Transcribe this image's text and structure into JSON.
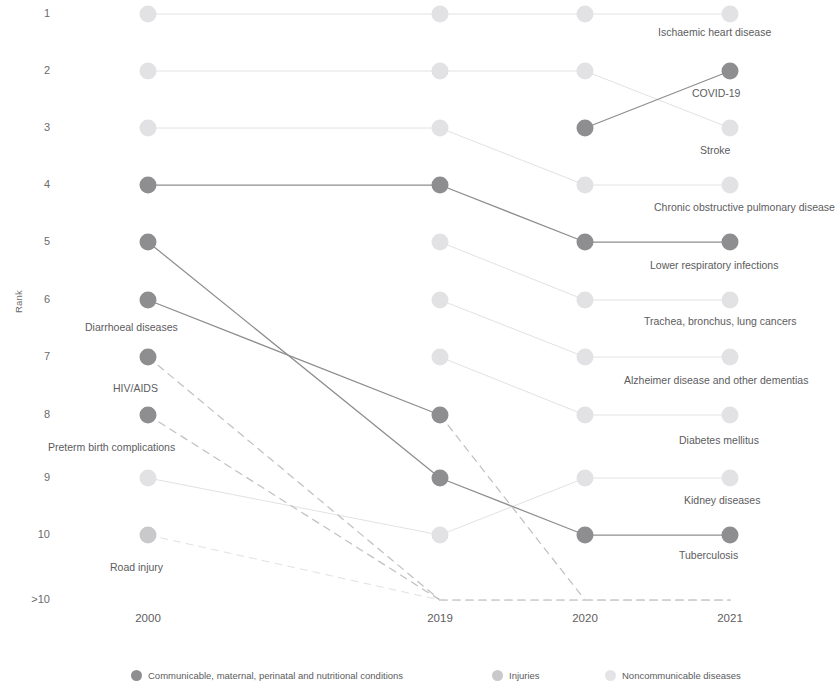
{
  "chart_data": {
    "type": "line",
    "title": "",
    "subtitle": "",
    "xlabel": "",
    "ylabel": "Rank",
    "x": [
      "2000",
      "2019",
      "2020",
      "2021"
    ],
    "ytick_labels": [
      "1",
      "2",
      "3",
      "4",
      "5",
      "6",
      "7",
      "8",
      "9",
      "10",
      ">10"
    ],
    "ylim": [
      1,
      11
    ],
    "grid": false,
    "legend_position": "bottom",
    "categories": [
      {
        "key": "communicable",
        "label": "Communicable, maternal, perinatal and nutritional conditions",
        "color": "#8e8e90"
      },
      {
        "key": "injuries",
        "label": "Injuries",
        "color": "#c9c9cb"
      },
      {
        "key": "noncommunicable",
        "label": "Noncommunicable diseases",
        "color": "#e2e2e4"
      }
    ],
    "series": [
      {
        "name": "Ischaemic heart disease",
        "category": "noncommunicable",
        "label_side": "right",
        "label_x": 2021,
        "ranks": [
          1,
          1,
          1,
          1
        ]
      },
      {
        "name": "Stroke",
        "category": "noncommunicable",
        "label_side": "right",
        "label_x": 2021,
        "ranks": [
          2,
          2,
          2,
          3
        ]
      },
      {
        "name": "COVID-19",
        "category": "communicable",
        "label_side": "right",
        "label_x": 2021,
        "ranks": [
          null,
          null,
          3,
          2
        ]
      },
      {
        "name": "Chronic obstructive pulmonary disease",
        "category": "noncommunicable",
        "label_side": "right",
        "label_x": 2021,
        "ranks": [
          3,
          3,
          4,
          4
        ]
      },
      {
        "name": "Lower respiratory infections",
        "category": "communicable",
        "label_side": "right",
        "label_x": 2021,
        "ranks": [
          4,
          4,
          5,
          5
        ]
      },
      {
        "name": "Trachea, bronchus, lung cancers",
        "category": "noncommunicable",
        "label_side": "right",
        "label_x": 2021,
        "ranks": [
          null,
          5,
          6,
          6
        ]
      },
      {
        "name": "Alzheimer disease and other dementias",
        "category": "noncommunicable",
        "label_side": "right",
        "label_x": 2021,
        "ranks": [
          null,
          6,
          7,
          7
        ]
      },
      {
        "name": "Diabetes mellitus",
        "category": "noncommunicable",
        "label_side": "right",
        "label_x": 2021,
        "ranks": [
          null,
          7,
          8,
          8
        ]
      },
      {
        "name": "Kidney diseases",
        "category": "noncommunicable",
        "label_side": "right",
        "label_x": 2021,
        "ranks": [
          9,
          10,
          9,
          9
        ]
      },
      {
        "name": "Tuberculosis",
        "category": "communicable",
        "label_side": "right",
        "label_x": 2021,
        "ranks": [
          5,
          9,
          10,
          10
        ]
      },
      {
        "name": "Diarrhoeal diseases",
        "category": "communicable",
        "label_side": "below",
        "label_x": 2000,
        "ranks": [
          6,
          8,
          11,
          11
        ]
      },
      {
        "name": "HIV/AIDS",
        "category": "communicable",
        "label_side": "below",
        "label_x": 2000,
        "ranks": [
          7,
          11,
          11,
          11
        ]
      },
      {
        "name": "Preterm birth complications",
        "category": "communicable",
        "label_side": "below",
        "label_x": 2000,
        "ranks": [
          8,
          11,
          11,
          11
        ]
      },
      {
        "name": "Road injury",
        "category": "injuries",
        "label_side": "below",
        "label_x": 2000,
        "ranks": [
          10,
          11,
          11,
          11
        ]
      }
    ]
  },
  "axis": {
    "y_label": "Rank",
    "y_ticks": [
      {
        "label": "1",
        "y": 14
      },
      {
        "label": "2",
        "y": 71
      },
      {
        "label": "3",
        "y": 128
      },
      {
        "label": "4",
        "y": 185
      },
      {
        "label": "5",
        "y": 242
      },
      {
        "label": "6",
        "y": 300
      },
      {
        "label": "7",
        "y": 357
      },
      {
        "label": "8",
        "y": 415
      },
      {
        "label": "9",
        "y": 478
      },
      {
        "label": "10",
        "y": 535
      },
      {
        "label": ">10",
        "y": 600
      }
    ],
    "x_ticks": [
      {
        "label": "2000",
        "x": 148
      },
      {
        "label": "2019",
        "x": 440
      },
      {
        "label": "2020",
        "x": 585
      },
      {
        "label": "2021",
        "x": 730
      }
    ]
  },
  "legend": {
    "items": [
      {
        "label": "Communicable, maternal, perinatal and nutritional conditions",
        "color": "#8e8e90",
        "x": 131
      },
      {
        "label": "Injuries",
        "color": "#c9c9cb",
        "x": 492
      },
      {
        "label": "Noncommunicable diseases",
        "color": "#e4e4e6",
        "x": 605
      }
    ]
  },
  "node_labels": [
    {
      "text": "Ischaemic heart disease",
      "x": 658,
      "y": 27
    },
    {
      "text": "COVID-19",
      "x": 692,
      "y": 88
    },
    {
      "text": "Stroke",
      "x": 700,
      "y": 145
    },
    {
      "text": "Chronic obstructive pulmonary disease",
      "x": 654,
      "y": 202
    },
    {
      "text": "Lower respiratory infections",
      "x": 650,
      "y": 260
    },
    {
      "text": "Trachea, bronchus, lung cancers",
      "x": 644,
      "y": 316
    },
    {
      "text": "Alzheimer disease and other dementias",
      "x": 624,
      "y": 375
    },
    {
      "text": "Diabetes mellitus",
      "x": 679,
      "y": 435
    },
    {
      "text": "Kidney diseases",
      "x": 684,
      "y": 495
    },
    {
      "text": "Tuberculosis",
      "x": 679,
      "y": 550
    },
    {
      "text": "Diarrhoeal diseases",
      "x": 85,
      "y": 322
    },
    {
      "text": "HIV/AIDS",
      "x": 113,
      "y": 383
    },
    {
      "text": "Preterm birth complications",
      "x": 48,
      "y": 442
    },
    {
      "text": "Road injury",
      "x": 110,
      "y": 562
    }
  ]
}
